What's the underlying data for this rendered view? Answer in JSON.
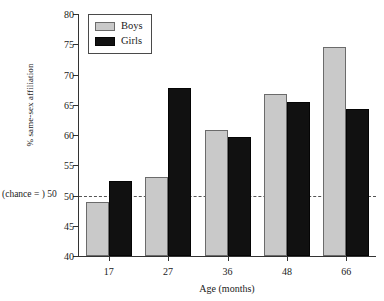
{
  "chart_data": {
    "type": "bar",
    "title": "",
    "subtitle": "",
    "xlabel": "Age (months)",
    "ylabel": "% same-sex affiliation",
    "categories": [
      "17",
      "27",
      "36",
      "48",
      "66"
    ],
    "series": [
      {
        "name": "Boys",
        "color": "#c9c9c9",
        "values": [
          48.9,
          53.0,
          60.8,
          66.7,
          74.6
        ]
      },
      {
        "name": "Girls",
        "color": "#111111",
        "values": [
          52.4,
          67.8,
          59.7,
          65.5,
          64.3
        ]
      }
    ],
    "ylim": [
      40,
      80
    ],
    "yticks": [
      40,
      45,
      50,
      55,
      60,
      65,
      70,
      75,
      80
    ],
    "ytick_labels": [
      "40",
      "45",
      "50",
      "55",
      "60",
      "65",
      "70",
      "75",
      "80"
    ],
    "grid": false,
    "legend_position": "top-left",
    "annotations": [
      {
        "name": "chance-line",
        "label": "(chance = ) 50",
        "value": 50,
        "style": "dashed-horizontal-line"
      }
    ]
  },
  "legend": {
    "items": [
      {
        "label": "Boys",
        "swatch": "light-gray-square"
      },
      {
        "label": "Girls",
        "swatch": "black-square"
      }
    ]
  },
  "axes": {
    "y_title": "% same-sex affiliation",
    "x_title": "Age (months)",
    "chance_label": "(chance = ) 50"
  }
}
